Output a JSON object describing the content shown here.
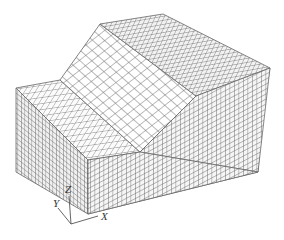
{
  "figure": {
    "colors": {
      "background": "#ffffff",
      "mesh_line": "#6a6a6a",
      "face_light": "#ffffff",
      "face_mid": "#f4f4f4",
      "face_dark": "#e6e6e6",
      "axis": "#555555"
    }
  },
  "axes": {
    "x_label": "X",
    "y_label": "Y",
    "z_label": "Z"
  }
}
